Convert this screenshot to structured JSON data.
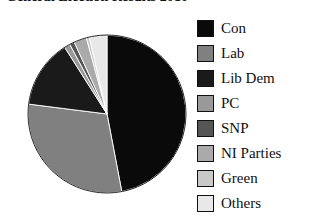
{
  "title": "General Election Results 2010",
  "chart_data": {
    "type": "pie",
    "title": "General Election Results 2010",
    "xlabel": "",
    "ylabel": "",
    "legend_position": "right",
    "grid": false,
    "start_angle_deg": 0,
    "direction": "clockwise",
    "categories": [
      "Con",
      "Lab",
      "Lib Dem",
      "PC",
      "SNP",
      "NI Parties",
      "Green",
      "Others"
    ],
    "values": [
      47.0,
      30.0,
      14.0,
      1.2,
      1.0,
      2.6,
      0.6,
      3.6
    ],
    "colors": [
      "#0a0a0a",
      "#808080",
      "#1a1a1a",
      "#999999",
      "#555555",
      "#aaaaaa",
      "#c8c8c8",
      "#e8e8e8"
    ],
    "slices": [
      {
        "label": "Con",
        "value": 47.0,
        "color": "#0a0a0a"
      },
      {
        "label": "Lab",
        "value": 30.0,
        "color": "#808080"
      },
      {
        "label": "Lib Dem",
        "value": 14.0,
        "color": "#1a1a1a"
      },
      {
        "label": "PC",
        "value": 1.2,
        "color": "#999999"
      },
      {
        "label": "SNP",
        "value": 1.0,
        "color": "#555555"
      },
      {
        "label": "NI Parties",
        "value": 2.6,
        "color": "#aaaaaa"
      },
      {
        "label": "Green",
        "value": 0.6,
        "color": "#c8c8c8"
      },
      {
        "label": "Others",
        "value": 3.6,
        "color": "#e8e8e8"
      }
    ]
  },
  "legend": {
    "items": [
      {
        "label": "Con",
        "color": "#0a0a0a"
      },
      {
        "label": "Lab",
        "color": "#808080"
      },
      {
        "label": "Lib Dem",
        "color": "#1a1a1a"
      },
      {
        "label": "PC",
        "color": "#999999"
      },
      {
        "label": "SNP",
        "color": "#555555"
      },
      {
        "label": "NI Parties",
        "color": "#aaaaaa"
      },
      {
        "label": "Green",
        "color": "#c8c8c8"
      },
      {
        "label": "Others",
        "color": "#e8e8e8"
      }
    ]
  }
}
